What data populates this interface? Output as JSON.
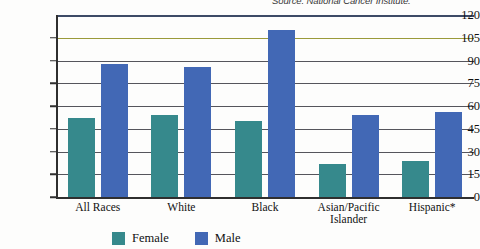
{
  "source_note": "Source: National Cancer Institute.",
  "chart_data": {
    "type": "bar",
    "title": "",
    "subtitle": "",
    "xlabel": "",
    "ylabel": "",
    "ylim": [
      0,
      120
    ],
    "yticks": [
      0,
      15,
      30,
      45,
      60,
      75,
      90,
      105,
      120
    ],
    "ytick_labels": [
      "0",
      "15",
      "30",
      "45",
      "60",
      "75",
      "90",
      "105",
      "120"
    ],
    "grid": true,
    "legend_position": "bottom",
    "categories": [
      "All Races",
      "White",
      "Black",
      "Asian/Pacific Islander",
      "Hispanic*"
    ],
    "series": [
      {
        "name": "Female",
        "color": "#36898c",
        "values": [
          52,
          54,
          50,
          22,
          24
        ]
      },
      {
        "name": "Male",
        "color": "#4268b5",
        "values": [
          88,
          86,
          110,
          54,
          56
        ]
      }
    ]
  },
  "legend": {
    "items": [
      {
        "label": "Female",
        "swatch": "female"
      },
      {
        "label": "Male",
        "swatch": "male"
      }
    ]
  }
}
